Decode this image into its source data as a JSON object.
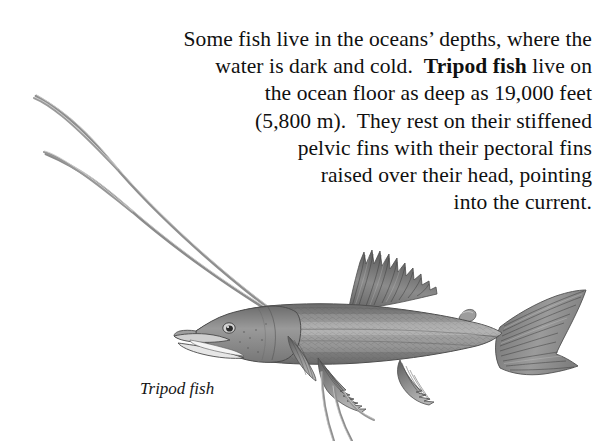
{
  "page": {
    "background_color": "#ffffff",
    "text_color": "#101010",
    "width": 610,
    "height": 441
  },
  "body_text": {
    "line1": "Some fish live in the oceans’ depths, where the",
    "line2_a": "water is dark and cold.  ",
    "line2_bold": "Tripod fish",
    "line2_b": " live on",
    "line3": "the ocean floor as deep as 19,000 feet",
    "line4": "(5,800 m).  They rest on their stiffened",
    "line5": "pelvic fins with their pectoral fins",
    "line6": "raised over their head, pointing",
    "line7": "into the current.",
    "full_text": "Some fish live in the oceans’ depths, where the water is dark and cold.  Tripod fish live on the ocean floor as deep as 19,000 feet (5,800 m).  They rest on their stiffened pelvic fins with their pectoral fins raised over their head, pointing into the current.",
    "emphasis_term": "Tripod fish",
    "depth_feet": "19,000 feet",
    "depth_meters": "5,800 m"
  },
  "caption": {
    "label": "Tripod fish"
  },
  "illustration": {
    "subject": "tripod-fish",
    "description": "Pencil-style grayscale drawing of a tripod fish in left-facing profile with long stiffened pelvic and pectoral fin rays",
    "ink_dark": "#4a4a4a",
    "ink_mid": "#8a8a8a",
    "ink_light": "#b8b8b8",
    "ink_pale": "#d6d6d6",
    "parts": [
      "pectoral-ray-upper",
      "pectoral-ray-lower",
      "head",
      "eye",
      "jaw",
      "dorsal-fin",
      "adipose-fin",
      "pelvic-fin",
      "anal-fin",
      "caudal-fin",
      "pelvic-trailing-rays"
    ]
  }
}
